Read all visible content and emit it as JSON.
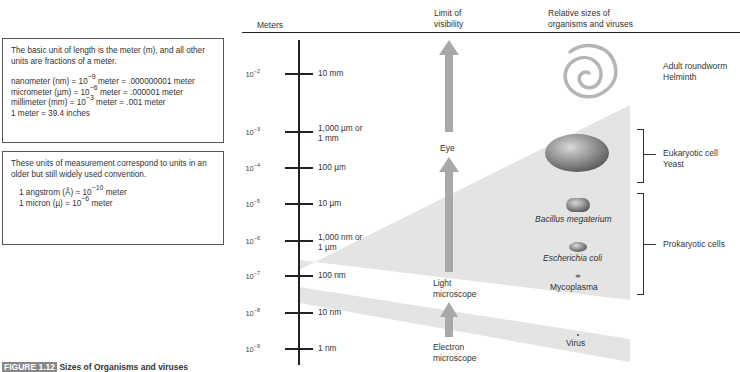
{
  "info_box_1": {
    "intro": "The basic unit of length is the meter (m), and all other units are fractions of a meter.",
    "lines": [
      {
        "pre": "nanometer (nm) = 10",
        "exp": "−9",
        "post": " meter = .000000001 meter"
      },
      {
        "pre": "micrometer (µm) = 10",
        "exp": "−6",
        "post": " meter = .000001 meter"
      },
      {
        "pre": "millimeter (mm) = 10",
        "exp": "−3",
        "post": " meter = .001 meter"
      },
      {
        "pre": "1 meter = 39.4 inches",
        "exp": "",
        "post": ""
      }
    ]
  },
  "info_box_2": {
    "intro": "These units of measurement correspond to units in an older but still widely used convention.",
    "lines": [
      {
        "pre": "1 angstrom (Å) = 10",
        "exp": "−10",
        "post": " meter"
      },
      {
        "pre": "1 micron (µ) = 10",
        "exp": "−6",
        "post": " meter"
      }
    ]
  },
  "headers": {
    "meters": "Meters",
    "visibility_1": "Limit of",
    "visibility_2": "visibility",
    "organisms_1": "Relative sizes of",
    "organisms_2": "organisms and viruses"
  },
  "scale": {
    "ticks": [
      {
        "base": "10",
        "exp": "−2",
        "label_1": "10 mm",
        "label_2": ""
      },
      {
        "base": "10",
        "exp": "−3",
        "label_1": "1,000 µm or",
        "label_2": "1 mm"
      },
      {
        "base": "10",
        "exp": "−4",
        "label_1": "100 µm",
        "label_2": ""
      },
      {
        "base": "10",
        "exp": "−5",
        "label_1": "10 µm",
        "label_2": ""
      },
      {
        "base": "10",
        "exp": "−6",
        "label_1": "1,000 nm or",
        "label_2": "1 µm"
      },
      {
        "base": "10",
        "exp": "−7",
        "label_1": "100 nm",
        "label_2": ""
      },
      {
        "base": "10",
        "exp": "−8",
        "label_1": "10 nm",
        "label_2": ""
      },
      {
        "base": "10",
        "exp": "−9",
        "label_1": "1 nm",
        "label_2": ""
      }
    ]
  },
  "visibility_limits": [
    {
      "label_1": "Eye",
      "label_2": ""
    },
    {
      "label_1": "Light",
      "label_2": "microscope"
    },
    {
      "label_1": "Electron",
      "label_2": "microscope"
    }
  ],
  "organisms": {
    "roundworm": {
      "label_1": "Adult roundworm",
      "label_2": "Helminth"
    },
    "eukaryotic": {
      "label_1": "Eukaryotic cell",
      "label_2": "Yeast"
    },
    "bacillus": "Bacillus megaterium",
    "ecoli": "Escherichia coli",
    "mycoplasma": "Mycoplasma",
    "prokaryotic": "Prokaryotic cells",
    "virus": "Virus"
  },
  "colors": {
    "band": "#e2e2e2",
    "arrow": "#a9a9a9",
    "axis": "#222222"
  },
  "caption": {
    "figure": "FIGURE 1.12",
    "text": "Sizes of Organisms and viruses"
  }
}
